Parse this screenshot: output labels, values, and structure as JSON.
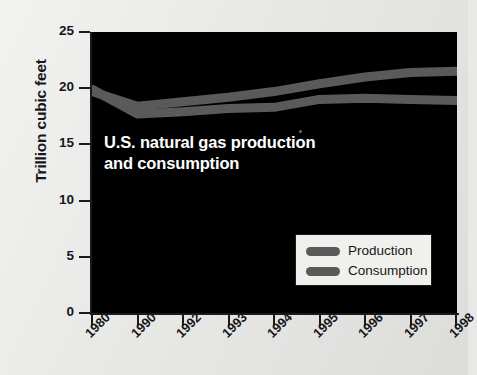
{
  "chart_data": {
    "type": "line",
    "title": "U.S. natural gas production and consumption",
    "title_lines": [
      "U.S. natural gas production",
      "and consumption"
    ],
    "xlabel": "",
    "ylabel": "Trillion cubic feet",
    "categories": [
      "1980",
      "1990",
      "1992",
      "1993",
      "1994",
      "1995",
      "1996",
      "1997",
      "1998"
    ],
    "series": [
      {
        "name": "Production",
        "values": [
          19.7,
          18.4,
          18.8,
          19.2,
          19.7,
          20.4,
          21.0,
          21.4,
          21.5
        ],
        "color": "#5a5a5a"
      },
      {
        "name": "Consumption",
        "values": [
          19.9,
          17.7,
          17.9,
          18.2,
          18.3,
          19.0,
          19.1,
          19.0,
          18.9
        ],
        "color": "#5a5a5a"
      }
    ],
    "ylim": [
      0,
      25
    ],
    "yticks": [
      0,
      5,
      10,
      15,
      20,
      25
    ],
    "ytick_labels": [
      "0",
      "5",
      "10",
      "15",
      "20",
      "25"
    ],
    "xtick_labels": [
      "1980",
      "1990",
      "1992",
      "1993",
      "1994",
      "1995",
      "1996",
      "1997",
      "1998"
    ],
    "grid": false,
    "legend_position": "inside-bottom-right",
    "legend_entries": [
      "Production",
      "Consumption"
    ],
    "plot_background": "#000000",
    "figure_background": "#e8e8e6",
    "line_color": "#5a5a5a",
    "text_color": "#17171a",
    "caption_color": "#ffffff"
  },
  "legend": {
    "entries": [
      {
        "label": "Production"
      },
      {
        "label": "Consumption"
      }
    ]
  }
}
